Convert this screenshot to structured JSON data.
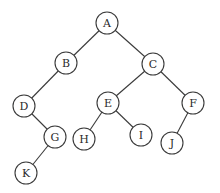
{
  "diagram": {
    "type": "binary-tree",
    "node_radius": 11,
    "colors": {
      "stroke": "#3a3a3a",
      "fill": "#ffffff",
      "text": "#2a2a2a"
    },
    "nodes": [
      {
        "id": "A",
        "label": "A",
        "x": 107,
        "y": 23
      },
      {
        "id": "B",
        "label": "B",
        "x": 66,
        "y": 63
      },
      {
        "id": "C",
        "label": "C",
        "x": 153,
        "y": 64
      },
      {
        "id": "D",
        "label": "D",
        "x": 24,
        "y": 106
      },
      {
        "id": "E",
        "label": "E",
        "x": 108,
        "y": 103
      },
      {
        "id": "F",
        "label": "F",
        "x": 193,
        "y": 103
      },
      {
        "id": "G",
        "label": "G",
        "x": 55,
        "y": 137
      },
      {
        "id": "H",
        "label": "H",
        "x": 84,
        "y": 139
      },
      {
        "id": "I",
        "label": "I",
        "x": 141,
        "y": 135
      },
      {
        "id": "J",
        "label": "J",
        "x": 172,
        "y": 143
      },
      {
        "id": "K",
        "label": "K",
        "x": 26,
        "y": 173
      }
    ],
    "edges": [
      {
        "from": "A",
        "to": "B"
      },
      {
        "from": "A",
        "to": "C"
      },
      {
        "from": "B",
        "to": "D"
      },
      {
        "from": "C",
        "to": "E"
      },
      {
        "from": "C",
        "to": "F"
      },
      {
        "from": "D",
        "to": "G"
      },
      {
        "from": "E",
        "to": "H"
      },
      {
        "from": "E",
        "to": "I"
      },
      {
        "from": "F",
        "to": "J"
      },
      {
        "from": "G",
        "to": "K"
      }
    ]
  }
}
